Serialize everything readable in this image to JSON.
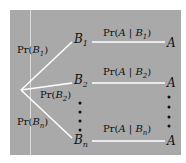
{
  "diagram": {
    "type": "probability-tree",
    "background": "#a9a9a9",
    "line_color": "#ffffff",
    "root": "root",
    "first_level": {
      "branches": [
        {
          "prob_label_prefix": "Pr(",
          "prob_var": "B",
          "prob_sub": "1",
          "prob_suffix": ")",
          "node_var": "B",
          "node_sub": "1"
        },
        {
          "prob_label_prefix": "Pr(",
          "prob_var": "B",
          "prob_sub": "2",
          "prob_suffix": ")",
          "node_var": "B",
          "node_sub": "2"
        },
        {
          "prob_label_prefix": "Pr(",
          "prob_var": "B",
          "prob_sub": "n",
          "prob_suffix": ")",
          "node_var": "B",
          "node_sub": "n"
        }
      ]
    },
    "second_level": {
      "branches": [
        {
          "prob_prefix": "Pr(",
          "prob_event": "A",
          "prob_bar": " | ",
          "prob_given": "B",
          "prob_sub": "1",
          "prob_suffix": ")",
          "outcome": "A"
        },
        {
          "prob_prefix": "Pr(",
          "prob_event": "A",
          "prob_bar": " | ",
          "prob_given": "B",
          "prob_sub": "2",
          "prob_suffix": ")",
          "outcome": "A"
        },
        {
          "prob_prefix": "Pr(",
          "prob_event": "A",
          "prob_bar": " | ",
          "prob_given": "B",
          "prob_sub": "n",
          "prob_suffix": ")",
          "outcome": "A"
        }
      ]
    },
    "ellipsis": "vertical-dots"
  }
}
